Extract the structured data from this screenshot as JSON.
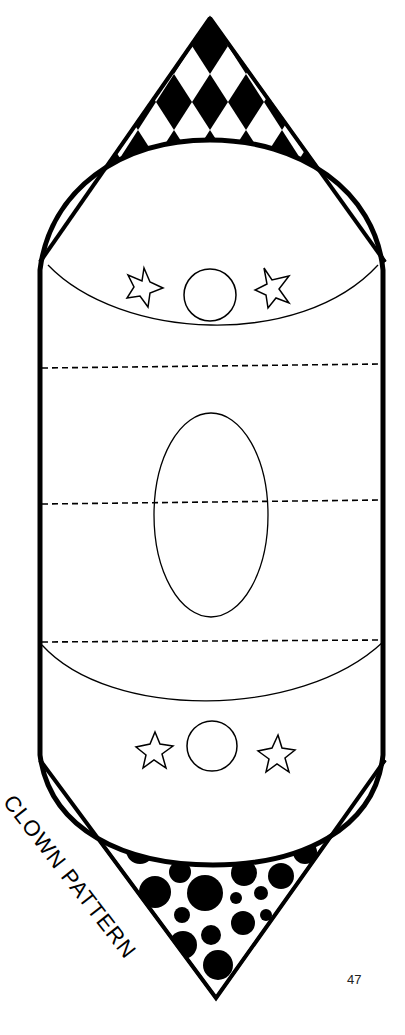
{
  "page": {
    "caption": "CLOWN PATTERN",
    "page_number": "47"
  },
  "pattern": {
    "parts": [
      "checkered-hat-tip",
      "upper-face-section",
      "middle-oval-section",
      "lower-face-section",
      "polka-dot-tip"
    ],
    "fold_lines": 3,
    "colors": {
      "ink": "#000000",
      "paper": "#ffffff"
    }
  }
}
